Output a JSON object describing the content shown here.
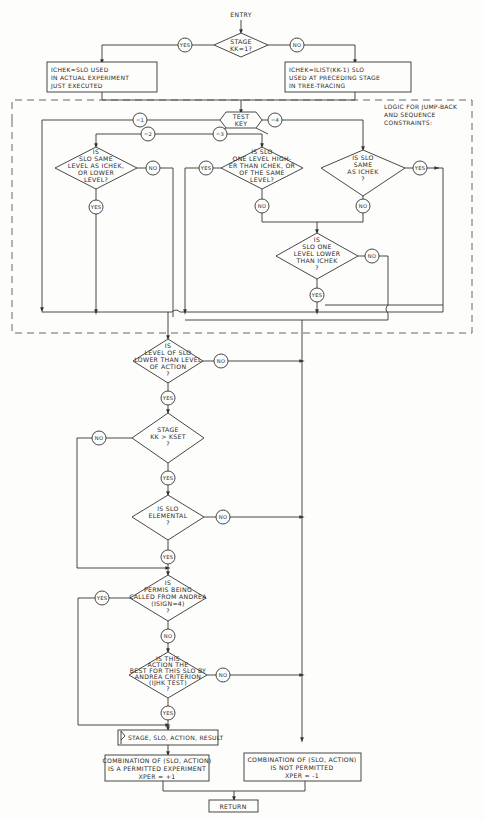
{
  "entry_label": "ENTRY",
  "return_label": "RETURN",
  "decisions": {
    "stage_first": [
      "STAGE",
      "KK=1?"
    ],
    "test_key": [
      "TEST",
      "KEY"
    ],
    "same_or_lower": [
      "IS",
      "SLO SAME",
      "LEVEL AS ICHEK,",
      "OR LOWER",
      "LEVEL?"
    ],
    "one_higher": [
      "IS SLO",
      "ONE LEVEL HIGH-",
      "ER THAN ICHEK, OR",
      "OF THE SAME",
      "LEVEL?"
    ],
    "same_as_ichek": [
      "IS SLO",
      "SAME",
      "AS ICHEK",
      "?"
    ],
    "one_lower": [
      "IS",
      "SLO ONE",
      "LEVEL LOWER",
      "THAN ICHEK",
      "?"
    ],
    "level_lower_action": [
      "IS",
      "LEVEL OF SLO",
      "LOWER THAN LEVEL",
      "OF ACTION",
      "?"
    ],
    "stage_kset": [
      "STAGE",
      "KK > KSET",
      "?"
    ],
    "elemental": [
      "IS SLO",
      "ELEMENTAL",
      "?"
    ],
    "called_andrea": [
      "IS",
      "PERMIS BEING",
      "CALLED FROM ANDREA",
      "(ISIGN=4)",
      "?"
    ],
    "best_action": [
      "IS THIS",
      "ACTION THE",
      "BEST FOR THIS SLO BY",
      "ANDREA CRITERION",
      "(IJHK TEST)",
      "?"
    ]
  },
  "processes": {
    "ichek_slo": [
      "ICHEK=SLO USED",
      "IN ACTUAL EXPERIMENT",
      "JUST EXECUTED"
    ],
    "ichek_ilist": [
      "ICHEK=ILIST(KK-1) SLO",
      "USED AT PRECEDING STAGE",
      "IN TREE-TRACING"
    ],
    "output": "STAGE, SLO, ACTION, RESULT",
    "permitted": [
      "COMBINATION OF (SLO, ACTION)",
      "IS A PERMITTED EXPERIMENT",
      "XPER = +1"
    ],
    "not_permitted": [
      "COMBINATION OF (SLO, ACTION)",
      "IS NOT PERMITTED",
      "XPER = -1"
    ]
  },
  "connectors": {
    "yes": "YES",
    "no": "NO",
    "key1": "=1",
    "key2": "=2",
    "key3": "=3",
    "key4": "=4"
  },
  "annotation": [
    "LOGIC FOR JUMP-BACK",
    "AND SEQUENCE",
    "CONSTRAINTS:"
  ]
}
